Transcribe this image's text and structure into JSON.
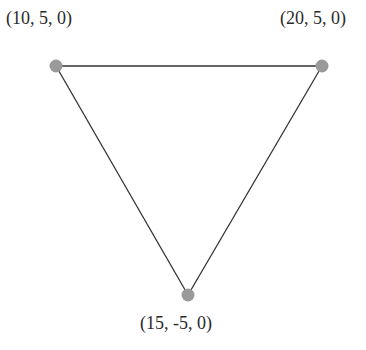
{
  "diagram": {
    "type": "triangle",
    "vertices": [
      {
        "id": "a",
        "label": "(10, 5, 0)",
        "x": 56,
        "y": 66,
        "label_x": 6,
        "label_y": 24
      },
      {
        "id": "b",
        "label": "(20, 5, 0)",
        "x": 322,
        "y": 66,
        "label_x": 280,
        "label_y": 24
      },
      {
        "id": "c",
        "label": "(15, -5, 0)",
        "x": 188,
        "y": 295,
        "label_x": 140,
        "label_y": 329
      }
    ],
    "edges": [
      [
        "a",
        "b"
      ],
      [
        "b",
        "c"
      ],
      [
        "c",
        "a"
      ]
    ],
    "colors": {
      "vertex": "#9a9a9a",
      "edge": "#333333",
      "text": "#2a2a2a"
    }
  }
}
